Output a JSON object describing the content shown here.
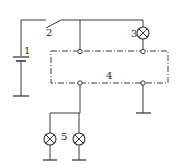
{
  "diagram": {
    "type": "circuit-schematic",
    "background": "#ffffff",
    "line_color": "#3a3a3a",
    "labels": {
      "battery": "1",
      "switch": "2",
      "lamp_top": "3",
      "relay_box": "4",
      "lamps_bottom": "5"
    },
    "components": [
      {
        "id": "1",
        "kind": "battery",
        "icon": "battery-icon"
      },
      {
        "id": "2",
        "kind": "switch",
        "icon": "switch-icon"
      },
      {
        "id": "3",
        "kind": "lamp",
        "icon": "lamp-icon"
      },
      {
        "id": "4",
        "kind": "dashed-module-box",
        "icon": "module-box"
      },
      {
        "id": "5",
        "kind": "lamp-pair",
        "icon": "lamp-icon",
        "count": 2
      }
    ],
    "ground_symbols": 5
  }
}
